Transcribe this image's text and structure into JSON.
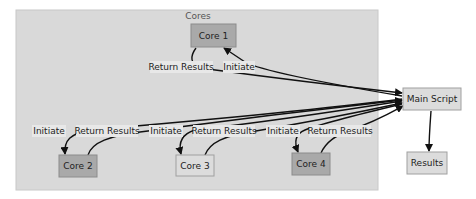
{
  "diagram": {
    "type": "flowchart",
    "cluster": {
      "label": "Cores",
      "fill": "#d9d9d9",
      "stroke": "#c8c8c8"
    },
    "nodes": {
      "core1": {
        "label": "Core 1",
        "fill": "#a9a9a9"
      },
      "core2": {
        "label": "Core 2",
        "fill": "#a9a9a9"
      },
      "core3": {
        "label": "Core 3",
        "fill": "#dcdcdc"
      },
      "core4": {
        "label": "Core 4",
        "fill": "#a9a9a9"
      },
      "main": {
        "label": "Main Script",
        "fill": "#dcdcdc"
      },
      "results": {
        "label": "Results",
        "fill": "#dcdcdc"
      }
    },
    "edge_labels": {
      "core1_return": "Return Results",
      "core1_initiate": "Initiate",
      "core2_initiate": "Initiate",
      "core2_return": "Return Results",
      "core3_initiate": "Initiate",
      "core3_return": "Return Results",
      "core4_initiate": "Initiate",
      "core4_return": "Return Results"
    },
    "edges": [
      {
        "from": "main",
        "to": "core1",
        "label": "Initiate"
      },
      {
        "from": "core1",
        "to": "main",
        "label": "Return Results"
      },
      {
        "from": "main",
        "to": "core2",
        "label": "Initiate"
      },
      {
        "from": "core2",
        "to": "main",
        "label": "Return Results"
      },
      {
        "from": "main",
        "to": "core3",
        "label": "Initiate"
      },
      {
        "from": "core3",
        "to": "main",
        "label": "Return Results"
      },
      {
        "from": "main",
        "to": "core4",
        "label": "Initiate"
      },
      {
        "from": "core4",
        "to": "main",
        "label": "Return Results"
      },
      {
        "from": "main",
        "to": "results",
        "label": ""
      }
    ]
  }
}
